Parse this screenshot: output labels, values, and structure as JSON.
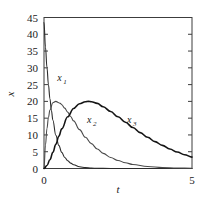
{
  "chart_data": {
    "type": "line",
    "title": "",
    "subtitle": "",
    "xlabel": "t",
    "ylabel": "x",
    "xlim": [
      0,
      5
    ],
    "ylim": [
      0,
      45
    ],
    "grid": false,
    "legend_position": "inline-annotations",
    "xticks": [
      0,
      5
    ],
    "xtick_labels": [
      "0",
      "5"
    ],
    "yticks": [
      0,
      5,
      10,
      15,
      20,
      25,
      30,
      35,
      40,
      45
    ],
    "ytick_labels": [
      "0",
      "5",
      "10",
      "15",
      "20",
      "25",
      "30",
      "35",
      "40",
      "45"
    ],
    "annotations": [
      {
        "text": "x",
        "sub": "1",
        "x": 0.45,
        "y": 26
      },
      {
        "text": "x",
        "sub": "2",
        "x": 1.45,
        "y": 13.5
      },
      {
        "text": "x",
        "sub": "3",
        "x": 2.8,
        "y": 13.5
      }
    ],
    "series": [
      {
        "name": "x1",
        "color": "#2b2b2b",
        "width": 1.1,
        "x": [
          0,
          0.05,
          0.1,
          0.15,
          0.2,
          0.25,
          0.3,
          0.4,
          0.5,
          0.6,
          0.7,
          0.8,
          0.9,
          1.0,
          1.2,
          1.4,
          1.6,
          1.8,
          2.0,
          2.5,
          3.0,
          3.5,
          4.0,
          4.5,
          5.0
        ],
        "y": [
          43.5,
          36.2,
          30.1,
          25.0,
          20.8,
          17.3,
          14.4,
          9.9,
          6.9,
          4.8,
          3.3,
          2.3,
          1.6,
          1.1,
          0.5,
          0.25,
          0.12,
          0.06,
          0.03,
          0.01,
          0.0,
          0.0,
          0.0,
          0.0,
          0.0
        ]
      },
      {
        "name": "x2",
        "color": "#4a4a4a",
        "width": 1.1,
        "x": [
          0,
          0.05,
          0.1,
          0.15,
          0.2,
          0.3,
          0.4,
          0.5,
          0.55,
          0.6,
          0.7,
          0.8,
          0.9,
          1.0,
          1.2,
          1.4,
          1.6,
          1.8,
          2.0,
          2.25,
          2.5,
          2.75,
          3.0,
          3.5,
          4.0,
          4.5,
          5.0
        ],
        "y": [
          0,
          7.0,
          11.9,
          15.2,
          17.4,
          19.6,
          20.0,
          19.6,
          19.4,
          19.0,
          18.0,
          16.8,
          15.5,
          14.2,
          11.6,
          9.3,
          7.4,
          5.8,
          4.5,
          3.3,
          2.4,
          1.7,
          1.2,
          0.6,
          0.3,
          0.15,
          0.08
        ]
      },
      {
        "name": "x3",
        "color": "#151515",
        "width": 1.6,
        "x": [
          0,
          0.1,
          0.2,
          0.3,
          0.4,
          0.5,
          0.6,
          0.8,
          1.0,
          1.2,
          1.4,
          1.5,
          1.6,
          1.8,
          2.0,
          2.25,
          2.5,
          2.75,
          3.0,
          3.25,
          3.5,
          3.75,
          4.0,
          4.25,
          4.5,
          4.75,
          5.0
        ],
        "y": [
          0,
          0.9,
          2.6,
          4.8,
          7.2,
          9.6,
          11.8,
          15.4,
          17.9,
          19.3,
          19.9,
          20.0,
          19.9,
          19.4,
          18.4,
          17.0,
          15.4,
          13.8,
          12.2,
          10.7,
          9.3,
          8.0,
          6.9,
          5.8,
          4.9,
          4.1,
          3.4
        ]
      }
    ]
  }
}
